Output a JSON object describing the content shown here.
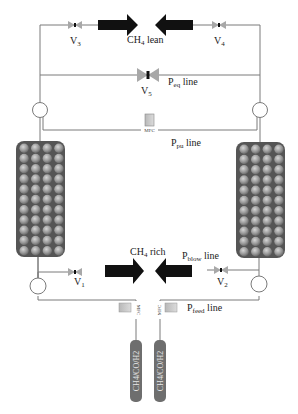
{
  "diagram": {
    "colors": {
      "line": "#7a7a7a",
      "arrow": "#111111",
      "column_fill": "#5a5a5a",
      "bead": "#9a9a9a",
      "valve": "#a8a8a8",
      "mfc_body": "#c9c9c9",
      "cylinder": "#6e6e6e"
    },
    "flows": {
      "top": {
        "label": "CH",
        "sub": "4",
        "suffix": " lean"
      },
      "bottom": {
        "label": "CH",
        "sub": "4",
        "suffix": " rich"
      }
    },
    "valves": {
      "v3": {
        "label": "V",
        "sub": "3"
      },
      "v4": {
        "label": "V",
        "sub": "4"
      },
      "v5": {
        "label": "V",
        "sub": "5"
      },
      "v1": {
        "label": "V",
        "sub": "1"
      },
      "v2": {
        "label": "V",
        "sub": "2"
      }
    },
    "lines": {
      "eq": {
        "label": "P",
        "sub": "eq",
        "suffix": " line"
      },
      "pu": {
        "label": "P",
        "sub": "pu",
        "suffix": " line"
      },
      "blow": {
        "label": "P",
        "sub": "blow",
        "suffix": " line"
      },
      "feed": {
        "label": "P",
        "sub": "feed",
        "suffix": " line"
      }
    },
    "mfc": {
      "label": "MFC"
    },
    "cylinders": [
      {
        "label": "CH4/CO/H2"
      },
      {
        "label": "CH4/CO/H2"
      }
    ],
    "columns": [
      {
        "name": "left-column",
        "rows": 11,
        "cols": 4
      },
      {
        "name": "right-column",
        "rows": 11,
        "cols": 4
      }
    ]
  }
}
